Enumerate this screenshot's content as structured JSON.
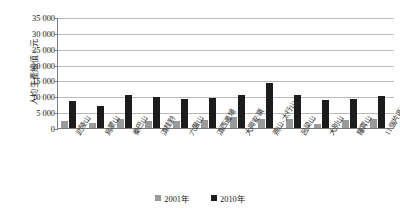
{
  "chart_data": {
    "type": "bar",
    "title": "",
    "xlabel": "",
    "ylabel": "人均生產總值 / 元",
    "ylim": [
      0,
      35000
    ],
    "ytick_step": 5000,
    "yticks": [
      "35 000",
      "30 000",
      "25 000",
      "20 000",
      "15 000",
      "10 000",
      "5 000",
      "0"
    ],
    "ytick_values": [
      35000,
      30000,
      25000,
      20000,
      15000,
      10000,
      5000,
      0
    ],
    "grid": "horizontal",
    "legend_position": "bottom-center",
    "categories": [
      "武陵山",
      "烏蒙山",
      "秦巴山",
      "滇桂黔",
      "六盤山",
      "滇西邊境",
      "大興安嶺",
      "燕山-太行山",
      "呂梁山",
      "大別山",
      "羅霄山",
      "11個片區平均值"
    ],
    "series": [
      {
        "name": "2001年",
        "color": "#9a9a9a",
        "values": [
          2300,
          1700,
          2800,
          2300,
          2200,
          2600,
          3500,
          2900,
          2800,
          1200,
          2600,
          3000
        ]
      },
      {
        "name": "2010年",
        "color": "#1c1c1c",
        "values": [
          8600,
          7000,
          10400,
          9800,
          9000,
          9600,
          10400,
          14100,
          10400,
          8700,
          9200,
          10000
        ]
      }
    ]
  },
  "legend": {
    "items": [
      {
        "label": "2001年",
        "color": "#9a9a9a"
      },
      {
        "label": "2010年",
        "color": "#1c1c1c"
      }
    ]
  }
}
